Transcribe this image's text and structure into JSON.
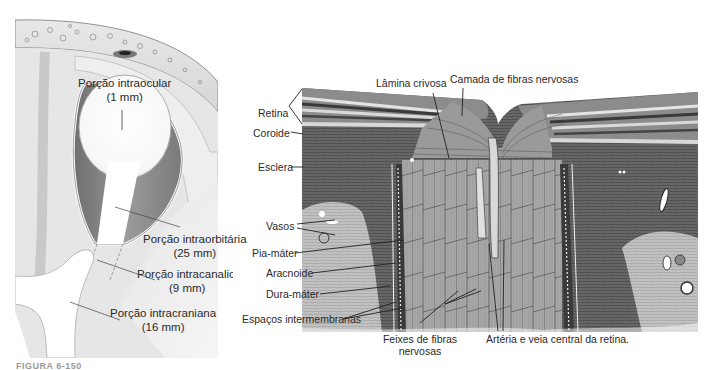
{
  "figure": {
    "caption_fragment": "FIGURA 6-150",
    "left_diagram": {
      "title": "Porções do nervo óptico",
      "labels": [
        {
          "name": "Porção intraocular",
          "measure": "(1  mm)"
        },
        {
          "name": "Porção intraorbitária",
          "measure": "(25 mm)"
        },
        {
          "name": "Porção intracanalicular",
          "measure": "(9 mm)"
        },
        {
          "name": "Porção intracraniana",
          "measure": "(16 mm)"
        }
      ]
    },
    "right_histology": {
      "labels": {
        "lamina_crivosa": "Lâmina crivosa",
        "camada_fibras": "Camada de fibras nervosas",
        "retina": "Retina",
        "coroide": "Coroide",
        "esclera": "Esclera",
        "vasos": "Vasos",
        "pia_mater": "Pia-máter",
        "aracnoide": "Aracnoide",
        "dura_mater": "Dura-máter",
        "espacos": "Espaços intermembranas",
        "feixes_1": "Feixes de fibras",
        "feixes_2": "nervosas",
        "arteria": "Artéria e veia central da retina."
      }
    },
    "colors": {
      "left_bg": "#f2f2f2",
      "globe_dark": "#8a8a8a",
      "nerve_white": "#ffffff",
      "tissue_dark": "#5a5a5a",
      "tissue_mid": "#9a9a9a",
      "tissue_light": "#cfcfcf"
    }
  }
}
